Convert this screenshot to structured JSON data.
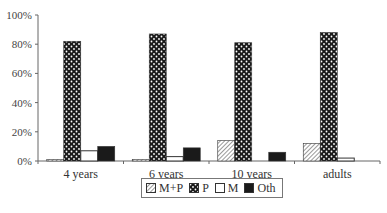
{
  "chart_data": {
    "type": "bar",
    "title": "",
    "xlabel": "",
    "ylabel": "",
    "ylim": [
      0,
      100
    ],
    "y_ticks": [
      "0%",
      "20%",
      "40%",
      "60%",
      "80%",
      "100%"
    ],
    "categories": [
      "4 years",
      "6 years",
      "10 years",
      "adults"
    ],
    "series": [
      {
        "name": "M+P",
        "pattern": "diagonal-hatch",
        "values": [
          1,
          1,
          14,
          12
        ]
      },
      {
        "name": "P",
        "pattern": "dotted-dark",
        "values": [
          82,
          87,
          81,
          88
        ]
      },
      {
        "name": "M",
        "pattern": "white",
        "values": [
          7,
          3,
          0,
          2
        ]
      },
      {
        "name": "Oth",
        "pattern": "solid-black",
        "values": [
          10,
          9,
          6,
          0
        ]
      }
    ],
    "legend_position": "bottom",
    "grid": false
  },
  "legend": {
    "items": [
      "M+P",
      "P",
      "M",
      "Oth"
    ]
  }
}
